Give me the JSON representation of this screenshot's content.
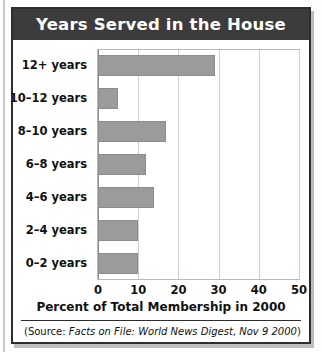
{
  "figure": {
    "title": "Years Served in the House",
    "source_prefix": "(Source: ",
    "source_italic_1": "Facts on File: World News Digest",
    "source_middle": ", ",
    "source_italic_2": "Nov 9 2000",
    "source_suffix": ")"
  },
  "colors": {
    "title_bar": "#3c3c3c",
    "title_text": "#ffffff",
    "bar_fill": "#9b9b9b",
    "bar_stroke": "#8d8d8d",
    "gridline": "#cfcfcf",
    "axis": "#8c8c8c",
    "frame": "#2e2e2e",
    "text": "#111111"
  },
  "chart_data": {
    "type": "bar",
    "orientation": "horizontal",
    "title": "Years Served in the House",
    "xlabel": "Percent of Total Membership in 2000",
    "ylabel": "",
    "xlim": [
      0,
      50
    ],
    "xticks": [
      0,
      10,
      20,
      30,
      40,
      50
    ],
    "xtick_labels": [
      "0",
      "10",
      "20",
      "30",
      "40",
      "50"
    ],
    "grid": true,
    "grid_axis": "x",
    "legend": false,
    "categories": [
      "0–2 years",
      "2–4 years",
      "4–6 years",
      "6–8 years",
      "8–10 years",
      "10–12 years",
      "12+ years"
    ],
    "values": [
      10,
      10,
      14,
      12,
      17,
      5,
      29
    ],
    "bars_top_to_bottom": [
      {
        "category": "12+ years",
        "value": 29
      },
      {
        "category": "10–12 years",
        "value": 5
      },
      {
        "category": "8–10 years",
        "value": 17
      },
      {
        "category": "6–8 years",
        "value": 12
      },
      {
        "category": "4–6 years",
        "value": 14
      },
      {
        "category": "2–4 years",
        "value": 10
      },
      {
        "category": "0–2 years",
        "value": 10
      }
    ],
    "units": "percent"
  }
}
